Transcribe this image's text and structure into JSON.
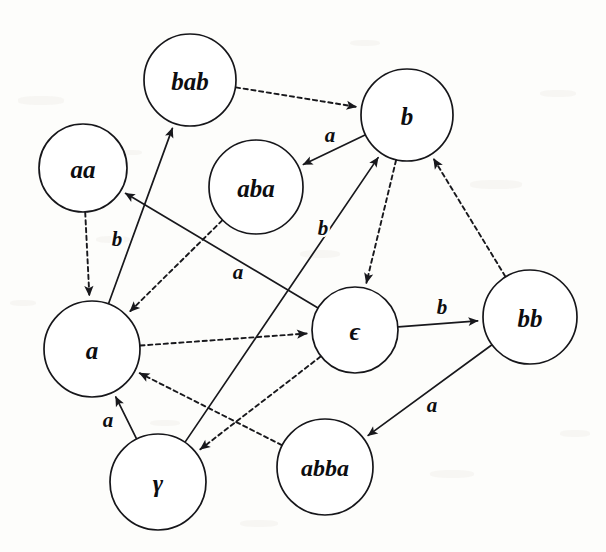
{
  "figure": {
    "kind": "directed-graph",
    "width": 606,
    "height": 552,
    "background_color": "#fdfdfb",
    "stroke_color": "#18181c",
    "node_fill": "#ffffff"
  },
  "nodes": [
    {
      "id": "bab",
      "label": "bab",
      "cx": 190,
      "cy": 80,
      "r": 46,
      "font_size": 25
    },
    {
      "id": "b",
      "label": "b",
      "cx": 407,
      "cy": 115,
      "r": 46,
      "font_size": 25
    },
    {
      "id": "aa",
      "label": "aa",
      "cx": 83,
      "cy": 168,
      "r": 44,
      "font_size": 25
    },
    {
      "id": "aba",
      "label": "aba",
      "cx": 256,
      "cy": 187,
      "r": 47,
      "font_size": 25
    },
    {
      "id": "a",
      "label": "a",
      "cx": 92,
      "cy": 349,
      "r": 48,
      "font_size": 25
    },
    {
      "id": "eps",
      "label": "ϵ",
      "cx": 355,
      "cy": 330,
      "r": 43,
      "font_size": 25
    },
    {
      "id": "bb",
      "label": "bb",
      "cx": 530,
      "cy": 317,
      "r": 47,
      "font_size": 25
    },
    {
      "id": "gamma",
      "label": "γ",
      "cx": 158,
      "cy": 482,
      "r": 48,
      "font_size": 25
    },
    {
      "id": "abba",
      "label": "abba",
      "cx": 325,
      "cy": 467,
      "r": 48,
      "font_size": 24
    }
  ],
  "edges": [
    {
      "id": "bab-to-b",
      "from": "bab",
      "to": "b",
      "style": "dashed",
      "label": "",
      "label_x": 0,
      "label_y": 0
    },
    {
      "id": "b-to-aba",
      "from": "b",
      "to": "aba",
      "style": "solid",
      "label": "a",
      "label_x": 330,
      "label_y": 135
    },
    {
      "id": "aa-to-a",
      "from": "aa",
      "to": "a",
      "style": "dashed",
      "label": "",
      "label_x": 0,
      "label_y": 0
    },
    {
      "id": "a-to-bab",
      "from": "a",
      "to": "bab",
      "style": "solid",
      "label": "b",
      "label_x": 117,
      "label_y": 239
    },
    {
      "id": "eps-to-aa",
      "from": "eps",
      "to": "aa",
      "style": "solid",
      "label": "a",
      "label_x": 238,
      "label_y": 272
    },
    {
      "id": "aba-to-a",
      "from": "aba",
      "to": "a",
      "style": "dashed",
      "label": "",
      "label_x": 0,
      "label_y": 0
    },
    {
      "id": "gamma-to-b",
      "from": "gamma",
      "to": "b",
      "style": "solid",
      "label": "b",
      "label_x": 323,
      "label_y": 228
    },
    {
      "id": "b-to-eps",
      "from": "b",
      "to": "eps",
      "style": "dashed",
      "label": "",
      "label_x": 0,
      "label_y": 0
    },
    {
      "id": "bb-to-b",
      "from": "bb",
      "to": "b",
      "style": "dashed",
      "label": "",
      "label_x": 0,
      "label_y": 0
    },
    {
      "id": "eps-to-bb",
      "from": "eps",
      "to": "bb",
      "style": "solid",
      "label": "b",
      "label_x": 442,
      "label_y": 307
    },
    {
      "id": "a-to-eps",
      "from": "a",
      "to": "eps",
      "style": "dashed",
      "label": "",
      "label_x": 0,
      "label_y": 0
    },
    {
      "id": "gamma-to-a",
      "from": "gamma",
      "to": "a",
      "style": "solid",
      "label": "a",
      "label_x": 108,
      "label_y": 420
    },
    {
      "id": "abba-to-a",
      "from": "abba",
      "to": "a",
      "style": "dashed",
      "label": "",
      "label_x": 0,
      "label_y": 0
    },
    {
      "id": "eps-to-gamma",
      "from": "eps",
      "to": "gamma",
      "style": "dashed",
      "label": "",
      "label_x": 0,
      "label_y": 0
    },
    {
      "id": "bb-to-abba",
      "from": "bb",
      "to": "abba",
      "style": "solid",
      "label": "a",
      "label_x": 432,
      "label_y": 405
    }
  ],
  "edge_labels": [
    {
      "text": "a",
      "x": 330,
      "y": 135
    },
    {
      "text": "b",
      "x": 117,
      "y": 239
    },
    {
      "text": "a",
      "x": 238,
      "y": 272
    },
    {
      "text": "b",
      "x": 323,
      "y": 228
    },
    {
      "text": "b",
      "x": 442,
      "y": 307
    },
    {
      "text": "a",
      "x": 108,
      "y": 420
    },
    {
      "text": "a",
      "x": 432,
      "y": 405
    }
  ],
  "alphabet": [
    "a",
    "b"
  ],
  "states": [
    "bab",
    "b",
    "aa",
    "aba",
    "a",
    "ϵ",
    "bb",
    "γ",
    "abba"
  ]
}
